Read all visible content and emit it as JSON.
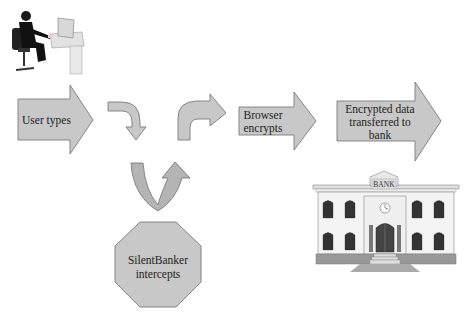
{
  "diagram": {
    "colors": {
      "shape_fill": "#c8c8c8",
      "shape_stroke": "#7a7a7a",
      "text": "#222222",
      "background": "#ffffff"
    },
    "nodes": [
      {
        "id": "user",
        "type": "image",
        "icon": "person-at-computer-icon"
      },
      {
        "id": "user-types",
        "type": "block-arrow",
        "label": "User types"
      },
      {
        "id": "bent-down",
        "type": "bent-arrow",
        "direction": "down"
      },
      {
        "id": "u-turn",
        "type": "u-arrow",
        "direction": "up"
      },
      {
        "id": "bent-right",
        "type": "bent-arrow",
        "direction": "right"
      },
      {
        "id": "browser-encrypts",
        "type": "block-arrow",
        "label_lines": [
          "Browser",
          "encrypts"
        ]
      },
      {
        "id": "encrypted-data",
        "type": "block-arrow",
        "label_lines": [
          "Encrypted data",
          "transferred to",
          "bank"
        ]
      },
      {
        "id": "silentbanker",
        "type": "octagon",
        "label_lines": [
          "SilentBanker",
          "intercepts"
        ]
      },
      {
        "id": "bank",
        "type": "image",
        "icon": "bank-building-icon",
        "sign": "BANK"
      }
    ],
    "flow": [
      "user",
      "user-types",
      "bent-down",
      "u-turn",
      "bent-right",
      "browser-encrypts",
      "encrypted-data",
      "bank"
    ],
    "interception": {
      "from": "u-turn",
      "by": "silentbanker"
    }
  }
}
